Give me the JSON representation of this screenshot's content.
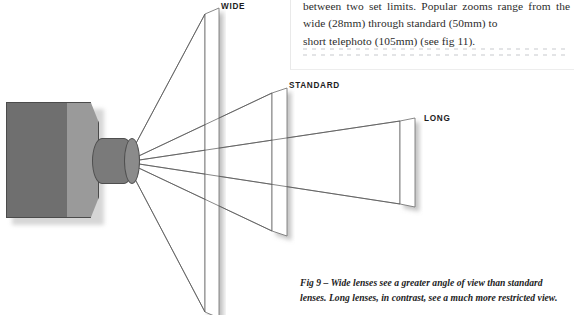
{
  "figure": {
    "type": "lens-angle-of-view-diagram",
    "label_wide": "WIDE",
    "label_standard": "STANDARD",
    "label_long": "LONG"
  },
  "body_text": {
    "line1": "between two set limits. Popular zooms range from",
    "line2": "the wide (28mm) through standard (50mm) to",
    "line3": "short telephoto (105mm) (see fig 11).",
    "full": "between two set limits. Popular zooms range from the wide (28mm) through standard (50mm) to short telephoto (105mm) (see fig 11)."
  },
  "caption": {
    "line1": "Fig 9 – Wide lenses see a greater angle of view than standard",
    "line2": "lenses. Long lenses, in contrast, see a much more restricted view.",
    "figure_number": "Fig 9"
  },
  "colors": {
    "camera_body": "#6f6f6f",
    "camera_side": "#9a9a9a",
    "camera_lens": "#7a7a7a",
    "outline": "#4b4b4b",
    "plane_fill": "#ffffff",
    "plane_stroke": "#5a5a5a",
    "text": "#2c2c2c",
    "dots": "#e3e4e6"
  },
  "dots": {
    "count_per_row": 30,
    "rows": 2
  }
}
